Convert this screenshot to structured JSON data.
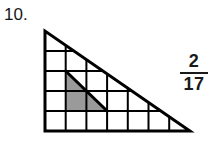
{
  "problem": {
    "number_label": "10."
  },
  "answer": {
    "numerator": "2",
    "denominator": "17",
    "fraction_text": "2/17"
  },
  "figure": {
    "shape": "right-triangle",
    "grid_columns": 7,
    "grid_rows": 5,
    "line_color": "#000000",
    "fill_color": "#ffffff",
    "shaded_color": "#9a9a9a",
    "outline_width": 3,
    "grid_width": 2,
    "triangle_vertices": [
      {
        "x": 0,
        "y": 0
      },
      {
        "x": 0,
        "y": 5
      },
      {
        "x": 7,
        "y": 5
      }
    ],
    "shaded_region_vertices": [
      {
        "x": 1,
        "y": 2
      },
      {
        "x": 1,
        "y": 4
      },
      {
        "x": 3,
        "y": 4
      }
    ],
    "shaded_area_cells": 2,
    "total_area_cells": 17.5
  }
}
